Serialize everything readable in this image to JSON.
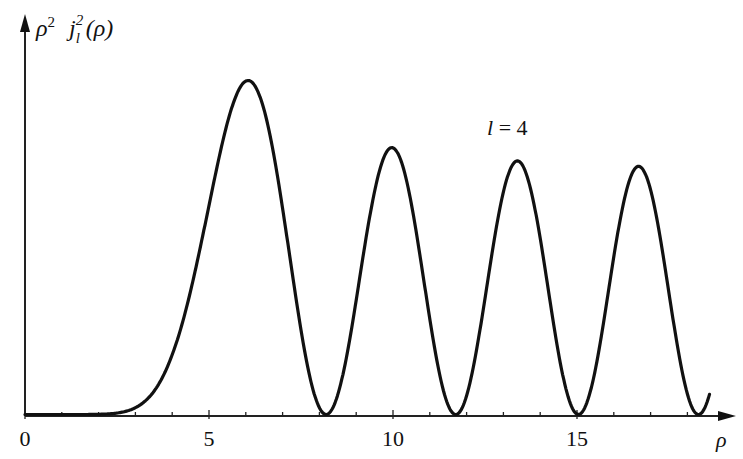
{
  "chart_data": {
    "type": "line",
    "title": "",
    "ylabel": "ρ² j_l²(ρ)",
    "ylabel_parts": {
      "rho": "ρ",
      "sq": "2",
      "j": "j",
      "sub": "l",
      "sup": "2",
      "arg": "(ρ)"
    },
    "xlabel": "ρ",
    "annotation": "l = 4",
    "annotation_parts": {
      "l": "l",
      "eq": " = 4"
    },
    "x_ticks": [
      0,
      5,
      10,
      15
    ],
    "x_tick_labels": [
      "0",
      "5",
      "10",
      "15"
    ],
    "minor_tick_step": 1.5,
    "xlim": [
      0,
      18.6
    ],
    "ylim": [
      0,
      1.06
    ],
    "grid": false,
    "legend": null,
    "l": 4,
    "series": [
      {
        "name": "rho^2 j_4^2(rho)",
        "x": [
          0,
          1,
          2,
          3,
          4,
          5,
          5.9,
          7,
          8.18,
          9,
          10.0,
          11,
          11.7,
          12.5,
          13.3,
          14.2,
          15.04,
          16,
          16.7,
          17.5,
          18.3,
          18.6
        ],
        "y": [
          0,
          0.0,
          0.004,
          0.04,
          0.19,
          0.57,
          0.89,
          0.53,
          0.0,
          0.27,
          0.71,
          0.3,
          0.0,
          0.29,
          0.63,
          0.3,
          0.0,
          0.39,
          0.6,
          0.37,
          0.0,
          0.04
        ]
      }
    ],
    "peaks": [
      {
        "x": 5.9,
        "y": 0.89
      },
      {
        "x": 10.0,
        "y": 0.71
      },
      {
        "x": 13.3,
        "y": 0.63
      },
      {
        "x": 16.7,
        "y": 0.6
      }
    ],
    "zeros": [
      8.18,
      11.7,
      15.04,
      18.3
    ]
  },
  "colors": {
    "line": "#111111",
    "axis": "#222222",
    "background": "#ffffff"
  },
  "layout": {
    "origin_x": 25,
    "origin_y": 416,
    "px_per_unit_x": 36.8,
    "px_per_unit_y": 370
  }
}
